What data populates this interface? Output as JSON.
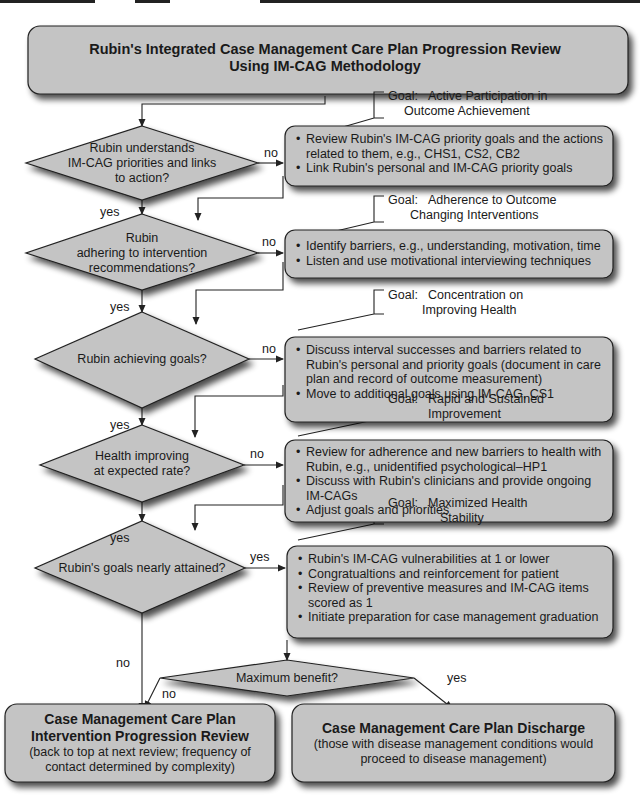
{
  "title": {
    "line1": "Rubin's Integrated Case Management Care Plan Progression Review",
    "line2": "Using IM-CAG Methodology"
  },
  "labels": {
    "yes": "yes",
    "no": "no"
  },
  "colors": {
    "shape_fill": "#c4c4c4",
    "stroke": "#222222",
    "background": "#ffffff"
  },
  "steps": [
    {
      "decision": [
        "Rubin understands",
        "IM-CAG priorities and links",
        "to action?"
      ],
      "branch_label": "no",
      "down_label": "yes",
      "goal": {
        "prefix": "Goal:",
        "line1": "Active Participation in",
        "line2": "Outcome Achievement"
      },
      "actions": [
        "Review Rubin's IM-CAG priority goals and the actions related to them, e.g., CHS1, CS2, CB2",
        "Link Rubin's personal and IM-CAG priority goals"
      ]
    },
    {
      "decision": [
        "Rubin",
        "adhering to intervention",
        "recommendations?"
      ],
      "branch_label": "no",
      "down_label": "yes",
      "goal": {
        "prefix": "Goal:",
        "line1": "Adherence to Outcome",
        "line2": "Changing Interventions"
      },
      "actions": [
        "Identify barriers, e.g., understanding, motivation, time",
        "Listen and use motivational interviewing techniques"
      ]
    },
    {
      "decision": [
        "Rubin achieving goals?"
      ],
      "branch_label": "no",
      "down_label": "yes",
      "goal": {
        "prefix": "Goal:",
        "line1": "Concentration on",
        "line2": "Improving Health"
      },
      "actions": [
        "Discuss interval successes and barriers related to Rubin's personal and priority goals (document in care plan and record of outcome measurement)",
        "Move to additional goals using IM-CAG, CS1"
      ]
    },
    {
      "decision": [
        "Health improving",
        "at expected rate?"
      ],
      "branch_label": "no",
      "down_label": "yes",
      "goal": {
        "prefix": "Goal:",
        "line1": "Rapid and Sustained",
        "line2": "Improvement"
      },
      "actions": [
        "Review for adherence and new barriers to health with Rubin, e.g., unidentified psychological–HP1",
        "Discuss with Rubin's clinicians and provide ongoing IM-CAGs",
        "Adjust goals and priorities"
      ]
    },
    {
      "decision": [
        "Rubin's goals nearly attained?"
      ],
      "branch_label": "yes",
      "down_label": "no",
      "goal": {
        "prefix": "Goal:",
        "line1": "Maximized Health",
        "line2": "Stability"
      },
      "actions": [
        "Rubin's IM-CAG vulnerabilities at 1 or lower",
        "Congratualtions and reinforcement for patient",
        "Review of preventive measures and IM-CAG items scored as 1",
        "Initiate preparation for case management graduation"
      ]
    }
  ],
  "max_benefit": {
    "question": "Maximum benefit?",
    "no_label": "no",
    "yes_label": "yes"
  },
  "outcomes": {
    "review": {
      "heading1": "Case Management Care Plan",
      "heading2": "Intervention Progression Review",
      "sub1": "(back to top at next review; frequency of",
      "sub2": "contact determined by complexity)"
    },
    "discharge": {
      "heading": "Case Management Care Plan Discharge",
      "sub1": "(those with disease management conditions would",
      "sub2": "proceed to disease management)"
    }
  }
}
